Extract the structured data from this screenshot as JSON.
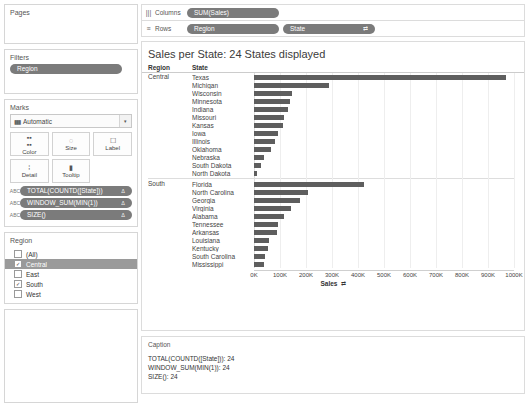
{
  "sidebar": {
    "pages": {
      "title": "Pages"
    },
    "filters": {
      "title": "Filters",
      "pills": [
        "Region"
      ]
    },
    "marks": {
      "title": "Marks",
      "mark_type": "Automatic",
      "mark_type_icon": "bar-chart-icon",
      "caret": "▾",
      "buttons": [
        {
          "label": "Color",
          "icon": "color-icon",
          "glyph": "▪▪\n▪▪"
        },
        {
          "label": "Size",
          "icon": "size-icon",
          "glyph": "◌"
        },
        {
          "label": "Label",
          "icon": "label-icon",
          "glyph": "T"
        },
        {
          "label": "Detail",
          "icon": "detail-icon",
          "glyph": "⁘"
        },
        {
          "label": "Tooltip",
          "icon": "tooltip-icon",
          "glyph": "▭"
        }
      ],
      "pills": [
        {
          "label": "TOTAL(COUNTD([State]))",
          "badge": "Δ",
          "icon": "abc-icon"
        },
        {
          "label": "WINDOW_SUM(MIN(1))",
          "badge": "Δ",
          "icon": "abc-icon"
        },
        {
          "label": "SIZE()",
          "badge": "Δ",
          "icon": "abc-icon"
        }
      ]
    },
    "legend": {
      "title": "Region",
      "items": [
        {
          "label": "(All)",
          "checked": false,
          "selected": false
        },
        {
          "label": "Central",
          "checked": true,
          "selected": true
        },
        {
          "label": "East",
          "checked": false,
          "selected": false
        },
        {
          "label": "South",
          "checked": true,
          "selected": false
        },
        {
          "label": "West",
          "checked": false,
          "selected": false
        }
      ],
      "check_glyph": "✓"
    }
  },
  "shelves": {
    "columns": {
      "label": "Columns",
      "icon": "columns-icon",
      "glyph": "|||",
      "pills": [
        {
          "label": "SUM(Sales)",
          "sort": ""
        }
      ]
    },
    "rows": {
      "label": "Rows",
      "icon": "rows-icon",
      "glyph": "≡",
      "pills": [
        {
          "label": "Region",
          "sort": ""
        },
        {
          "label": "State",
          "sort": "⇄"
        }
      ]
    }
  },
  "viz": {
    "title": "Sales per State: 24 States displayed",
    "header_region": "Region",
    "header_state": "State"
  },
  "caption": {
    "title": "Caption",
    "lines": [
      "TOTAL(COUNTD([State])): 24",
      "WINDOW_SUM(MIN(1)): 24",
      "SIZE(): 24"
    ]
  },
  "chart_data": {
    "type": "bar",
    "title": "Sales per State: 24 States displayed",
    "xlabel": "Sales",
    "ylabel": "State",
    "xlim": [
      0,
      1000
    ],
    "x_unit": "K",
    "grid": true,
    "legend_position": "none",
    "tick_labels": [
      "0K",
      "100K",
      "200K",
      "300K",
      "400K",
      "500K",
      "600K",
      "700K",
      "800K",
      "900K",
      "1000K"
    ],
    "tick_values": [
      0,
      100,
      200,
      300,
      400,
      500,
      600,
      700,
      800,
      900,
      1000
    ],
    "bar_color": "#5e5e5e",
    "groups": [
      {
        "region": "Central",
        "categories": [
          "Texas",
          "Michigan",
          "Wisconsin",
          "Minnesota",
          "Indiana",
          "Missouri",
          "Kansas",
          "Iowa",
          "Illinois",
          "Oklahoma",
          "Nebraska",
          "South Dakota",
          "North Dakota"
        ],
        "values": [
          969,
          288,
          146,
          137,
          132,
          117,
          113,
          94,
          80,
          65,
          38,
          26,
          10
        ]
      },
      {
        "region": "South",
        "categories": [
          "Florida",
          "North Carolina",
          "Georgia",
          "Virginia",
          "Alabama",
          "Tennessee",
          "Arkansas",
          "Louisiana",
          "Kentucky",
          "South Carolina",
          "Mississippi"
        ],
        "values": [
          423,
          208,
          176,
          142,
          114,
          93,
          90,
          58,
          52,
          44,
          40
        ]
      }
    ]
  }
}
